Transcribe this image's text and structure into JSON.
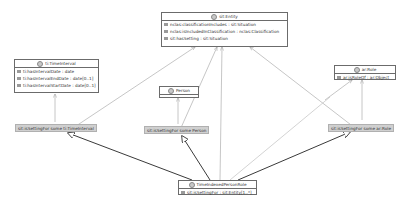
{
  "diagram": {
    "type": "UML class diagram",
    "classes": {
      "entity": {
        "name": "sit:Entity",
        "attributes": [
          {
            "name": "nclas:classificationIncludes",
            "type": ": sit:Situation"
          },
          {
            "name": "nclas:isIncludedInClassification",
            "type": ": nclas:Classification"
          },
          {
            "name": "sit:hasSetting",
            "type": ": sit:Situation"
          }
        ]
      },
      "time_interval": {
        "name": "ti:TimeInterval",
        "attributes": [
          {
            "name": "ti:hasIntervalDate",
            "type": ": date"
          },
          {
            "name": "ti:hasIntervalEndDate",
            "type": ": date[0..1]"
          },
          {
            "name": "ti:hasIntervalStartDate",
            "type": ": date[0..1]"
          }
        ]
      },
      "person": {
        "name": "Person",
        "attributes": []
      },
      "role": {
        "name": "ar:Role",
        "attributes": [
          {
            "name": "ar:isRoleOf",
            "type": ": ar:Object"
          }
        ]
      },
      "time_indexed_person_role": {
        "name": "TimeIndexedPersonRole",
        "attributes": [
          {
            "name": "sit:isSettingFor",
            "type": ": sit:Entity[1..*]"
          }
        ]
      }
    },
    "restrictions": {
      "time_interval": "sit:isSettingFor some ti:TimeInterval",
      "person": "sit:isSettingFor some Person",
      "role": "sit:isSettingFor some ar:Role"
    },
    "colors": {
      "box_border": "#6b6b6b",
      "restriction_bg": "#d0d0d0",
      "light_line": "#b8b8b8",
      "dark_line": "#3a3a3a"
    }
  }
}
